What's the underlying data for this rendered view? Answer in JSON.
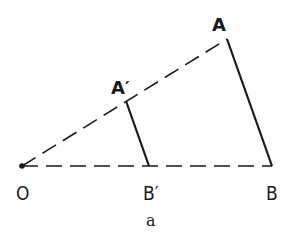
{
  "figure": {
    "caption": "a",
    "points": {
      "O": {
        "label": "O",
        "x": 22,
        "y": 166
      },
      "A": {
        "label": "A",
        "x": 227,
        "y": 39
      },
      "A_prime": {
        "label": "A′",
        "x": 126,
        "y": 101
      },
      "B": {
        "label": "B",
        "x": 272,
        "y": 166
      },
      "B_prime": {
        "label": "B′",
        "x": 149,
        "y": 166
      }
    },
    "lines": [
      {
        "from": "O",
        "to": "A",
        "style": "dashed"
      },
      {
        "from": "O",
        "to": "B",
        "style": "dashed"
      },
      {
        "from": "A",
        "to": "B",
        "style": "solid"
      },
      {
        "from": "A_prime",
        "to": "B_prime",
        "style": "solid"
      }
    ],
    "colors": {
      "ink": "#1a1a1a",
      "background": "#ffffff"
    }
  }
}
